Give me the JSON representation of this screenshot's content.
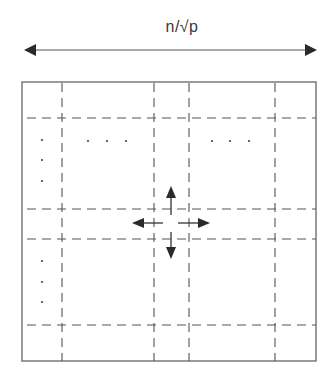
{
  "diagram": {
    "dimension_label": "n/√p",
    "dimension_arrow": {
      "x1": 24,
      "x2": 317,
      "y": 50
    },
    "colors": {
      "line": "#555555",
      "border": "#666666",
      "arrow": "#2a2a2a",
      "dots": "#444444",
      "label": "#3a3a3a",
      "background": "#ffffff"
    },
    "outer_box": {
      "left": 22,
      "top": 82,
      "right": 316,
      "bottom": 361
    },
    "vertical_dashed_lines_x": [
      62,
      154,
      189,
      275
    ],
    "horizontal_dashed_lines_y": [
      118,
      209,
      239,
      325
    ],
    "ellipsis_dots": [
      {
        "x": 42,
        "y": 140
      },
      {
        "x": 42,
        "y": 160
      },
      {
        "x": 42,
        "y": 181
      },
      {
        "x": 88,
        "y": 141
      },
      {
        "x": 107,
        "y": 141
      },
      {
        "x": 126,
        "y": 141
      },
      {
        "x": 212,
        "y": 141
      },
      {
        "x": 230,
        "y": 141
      },
      {
        "x": 249,
        "y": 141
      },
      {
        "x": 42,
        "y": 261
      },
      {
        "x": 42,
        "y": 282
      },
      {
        "x": 42,
        "y": 302
      }
    ],
    "communication_arrows": [
      {
        "direction": "up",
        "label": "north-neighbor"
      },
      {
        "direction": "down",
        "label": "south-neighbor"
      },
      {
        "direction": "left",
        "label": "west-neighbor"
      },
      {
        "direction": "right",
        "label": "east-neighbor"
      }
    ]
  }
}
